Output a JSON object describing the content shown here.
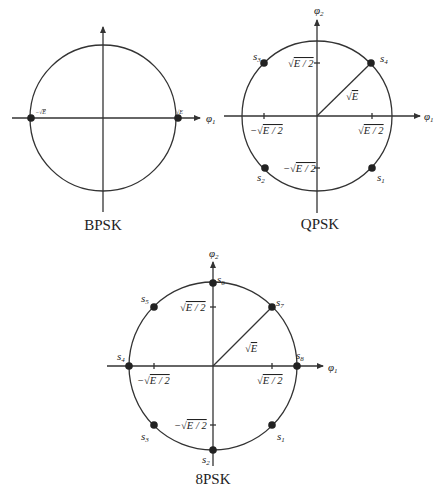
{
  "figure": {
    "diagrams": [
      {
        "id": "bpsk",
        "title": "BPSK",
        "axis_x_label": "φ1",
        "points": [
          {
            "label": "-√E",
            "angle_deg": 180
          },
          {
            "label": "√E",
            "angle_deg": 0
          }
        ]
      },
      {
        "id": "qpsk",
        "title": "QPSK",
        "axis_x_label": "φ1",
        "axis_y_label": "φ2",
        "radius_label": "√E",
        "ticks": {
          "x_pos": "√E/2",
          "x_neg": "−√E/2",
          "y_pos": "√E/2",
          "y_neg": "−√E/2"
        },
        "points": [
          {
            "label": "s1",
            "angle_deg": -45
          },
          {
            "label": "s2",
            "angle_deg": -135
          },
          {
            "label": "s3",
            "angle_deg": 135
          },
          {
            "label": "s4",
            "angle_deg": 45
          }
        ]
      },
      {
        "id": "8psk",
        "title": "8PSK",
        "axis_x_label": "φ1",
        "axis_y_label": "φ2",
        "radius_label": "√E",
        "ticks": {
          "x_pos": "√E/2",
          "x_neg": "−√E/2",
          "y_pos": "√E/2",
          "y_neg": "−√E/2"
        },
        "points": [
          {
            "label": "s1",
            "angle_deg": -45
          },
          {
            "label": "s2",
            "angle_deg": -90
          },
          {
            "label": "s3",
            "angle_deg": -135
          },
          {
            "label": "s4",
            "angle_deg": 180
          },
          {
            "label": "s5",
            "angle_deg": 135
          },
          {
            "label": "s6",
            "angle_deg": 90
          },
          {
            "label": "s7",
            "angle_deg": 45
          },
          {
            "label": "s8",
            "angle_deg": 0
          }
        ]
      }
    ]
  },
  "text": {
    "bpsk_title": "BPSK",
    "qpsk_title": "QPSK",
    "psk8_title": "8PSK",
    "phi": "φ",
    "sub1": "1",
    "sub2": "2",
    "sqrtE": "E",
    "sqrtE2": "E / 2",
    "minus": "−",
    "s": "s",
    "n1": "1",
    "n2": "2",
    "n3": "3",
    "n4": "4",
    "n5": "5",
    "n6": "6",
    "n7": "7",
    "n8": "8"
  }
}
